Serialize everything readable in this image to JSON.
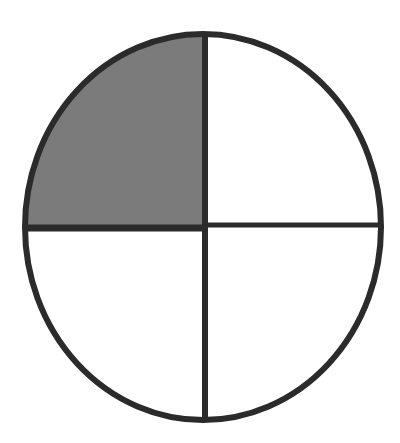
{
  "diagram": {
    "type": "fraction-circle",
    "parts_total": 4,
    "parts_shaded": 1,
    "shaded_quadrant": "top-left",
    "colors": {
      "background": "#ffffff",
      "outline": "#2b2b2b",
      "shaded_fill": "#7b7b7b",
      "unshaded_fill": "#ffffff"
    }
  }
}
